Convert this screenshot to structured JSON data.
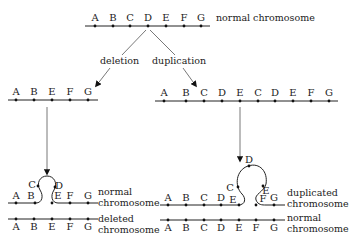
{
  "diagram": {
    "top": {
      "genes": [
        "A",
        "B",
        "C",
        "D",
        "E",
        "F",
        "G"
      ],
      "label": "normal chromosome"
    },
    "branches": {
      "left_label": "deletion",
      "right_label": "duplication"
    },
    "deletion_result": {
      "genes": [
        "A",
        "B",
        "E",
        "F",
        "G"
      ]
    },
    "duplication_result": {
      "genes": [
        "A",
        "B",
        "C",
        "D",
        "E",
        "C",
        "D",
        "E",
        "F",
        "G"
      ]
    },
    "left_pairing": {
      "upper_genes_line": [
        "A",
        "B",
        "E",
        "F",
        "G"
      ],
      "loop_genes": [
        "C",
        "D"
      ],
      "upper_label_1": "normal",
      "upper_label_2": "chromosome",
      "lower_genes": [
        "A",
        "B",
        "E",
        "F",
        "G"
      ],
      "lower_label_1": "deleted",
      "lower_label_2": "chromosome"
    },
    "right_pairing": {
      "upper_genes_line": [
        "A",
        "B",
        "C",
        "D",
        "E",
        "F",
        "G"
      ],
      "loop_genes": [
        "C",
        "D",
        "E"
      ],
      "upper_label_1": "duplicated",
      "upper_label_2": "chromosome",
      "lower_genes": [
        "A",
        "B",
        "C",
        "D",
        "E",
        "F",
        "G"
      ],
      "lower_label_1": "normal",
      "lower_label_2": "chromosome"
    }
  }
}
